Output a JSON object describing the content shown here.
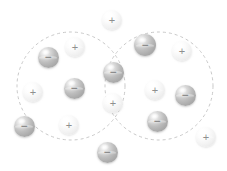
{
  "figure": {
    "width": 227,
    "height": 171,
    "background_color": "#ffffff"
  },
  "regions": {
    "stroke_color": "#c9c9c9",
    "dash_pattern": "3 3",
    "stroke_width": 1,
    "items": [
      {
        "name": "left-region",
        "cx": 71,
        "cy": 86,
        "r": 54
      },
      {
        "name": "right-region",
        "cx": 159,
        "cy": 86,
        "r": 54
      }
    ]
  },
  "legend": {
    "positive_symbol": "+",
    "negative_symbol": "−",
    "positive_color": "#f2f2f2",
    "negative_color": "#b0b0b0"
  },
  "charges": [
    {
      "id": "c01",
      "sign": "+",
      "charge": "positive",
      "x": 112,
      "y": 20,
      "d": 20,
      "region": "outside-top"
    },
    {
      "id": "c02",
      "sign": "+",
      "charge": "positive",
      "x": 75,
      "y": 47,
      "d": 20,
      "region": "left"
    },
    {
      "id": "c03",
      "sign": "−",
      "charge": "negative",
      "x": 48,
      "y": 57,
      "d": 21,
      "region": "left"
    },
    {
      "id": "c04",
      "sign": "+",
      "charge": "positive",
      "x": 33,
      "y": 92,
      "d": 20,
      "region": "left"
    },
    {
      "id": "c05",
      "sign": "−",
      "charge": "negative",
      "x": 74,
      "y": 88,
      "d": 21,
      "region": "left"
    },
    {
      "id": "c06",
      "sign": "+",
      "charge": "positive",
      "x": 69,
      "y": 125,
      "d": 20,
      "region": "left"
    },
    {
      "id": "c07",
      "sign": "−",
      "charge": "negative",
      "x": 24,
      "y": 126,
      "d": 21,
      "region": "outside-left"
    },
    {
      "id": "c08",
      "sign": "−",
      "charge": "negative",
      "x": 113,
      "y": 72,
      "d": 21,
      "region": "overlap"
    },
    {
      "id": "c09",
      "sign": "+",
      "charge": "positive",
      "x": 113,
      "y": 103,
      "d": 20,
      "region": "overlap"
    },
    {
      "id": "c10",
      "sign": "−",
      "charge": "negative",
      "x": 107,
      "y": 152,
      "d": 21,
      "region": "outside-bottom"
    },
    {
      "id": "c11",
      "sign": "−",
      "charge": "negative",
      "x": 145,
      "y": 45,
      "d": 22,
      "region": "right"
    },
    {
      "id": "c12",
      "sign": "+",
      "charge": "positive",
      "x": 182,
      "y": 51,
      "d": 20,
      "region": "right"
    },
    {
      "id": "c13",
      "sign": "+",
      "charge": "positive",
      "x": 155,
      "y": 90,
      "d": 20,
      "region": "right"
    },
    {
      "id": "c14",
      "sign": "−",
      "charge": "negative",
      "x": 185,
      "y": 95,
      "d": 21,
      "region": "right"
    },
    {
      "id": "c15",
      "sign": "−",
      "charge": "negative",
      "x": 157,
      "y": 121,
      "d": 21,
      "region": "right"
    },
    {
      "id": "c16",
      "sign": "+",
      "charge": "positive",
      "x": 206,
      "y": 137,
      "d": 20,
      "region": "outside-right"
    }
  ]
}
